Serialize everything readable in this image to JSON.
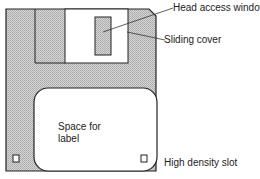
{
  "diagram": {
    "colors": {
      "body_fill": "#c4c4c4",
      "outline": "#222222",
      "background": "#ffffff"
    },
    "labels": {
      "head_access_window": "Head access window",
      "sliding_cover": "Sliding cover",
      "space_for_label_line1": "Space for",
      "space_for_label_line2": "label",
      "high_density_slot": "High density slot"
    }
  }
}
